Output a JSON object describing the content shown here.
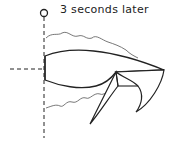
{
  "diagram": {
    "caption": "3 seconds later",
    "elements": [
      "origin-marker",
      "vertical-dashed-axis",
      "horizontal-dashed-axis",
      "shape-body",
      "folded-flap",
      "wavy-trail-top",
      "wavy-trail-bottom"
    ],
    "colors": {
      "stroke": "#222222",
      "trail": "#555555",
      "background": "#ffffff"
    }
  }
}
